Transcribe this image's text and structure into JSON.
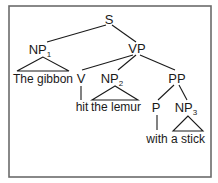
{
  "diagram": {
    "type": "syntax-tree",
    "nodes": {
      "s": {
        "label": "S",
        "sub": ""
      },
      "np1": {
        "label": "NP",
        "sub": "1"
      },
      "vp": {
        "label": "VP",
        "sub": ""
      },
      "v": {
        "label": "V",
        "sub": ""
      },
      "np2": {
        "label": "NP",
        "sub": "2"
      },
      "pp": {
        "label": "PP",
        "sub": ""
      },
      "p": {
        "label": "P",
        "sub": ""
      },
      "np3": {
        "label": "NP",
        "sub": "3"
      }
    },
    "leaves": {
      "np1": "The gibbon",
      "v": "hit",
      "np2": "the lemur",
      "p": "with",
      "np3": "a stick"
    },
    "edges": [
      [
        "S",
        "NP1"
      ],
      [
        "S",
        "VP"
      ],
      [
        "VP",
        "V"
      ],
      [
        "VP",
        "NP2"
      ],
      [
        "VP",
        "PP"
      ],
      [
        "PP",
        "P"
      ],
      [
        "PP",
        "NP3"
      ]
    ]
  }
}
